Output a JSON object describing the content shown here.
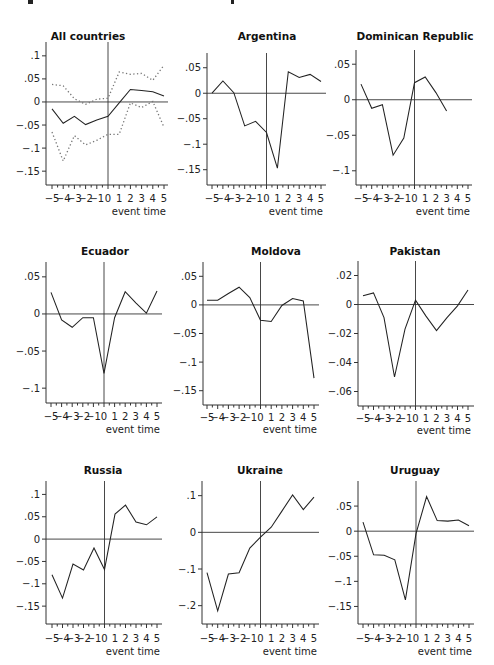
{
  "chart_data": [
    {
      "type": "line",
      "title": "All countries",
      "xlabel": "event time",
      "ylabel": "",
      "x": [
        -5,
        -4,
        -3,
        -2,
        -1,
        0,
        1,
        2,
        3,
        4,
        5
      ],
      "x_tick_labels": [
        "−5",
        "−4",
        "−3",
        "−2",
        "−1",
        "0",
        "1",
        "2",
        "3",
        "4",
        "5"
      ],
      "y_ticks": [
        0.1,
        0.05,
        0,
        -0.05,
        -0.1,
        -0.15
      ],
      "y_tick_labels": [
        ".1",
        ".05",
        "0",
        "−.05",
        "−.1",
        "−.15"
      ],
      "ylim": [
        -0.18,
        0.13
      ],
      "series": [
        {
          "name": "estimate",
          "style": "solid",
          "values": [
            -0.015,
            -0.046,
            -0.031,
            -0.049,
            -0.039,
            -0.031,
            -0.002,
            0.027,
            0.025,
            0.022,
            0.013
          ]
        },
        {
          "name": "upper CI",
          "style": "dotted",
          "values": [
            0.038,
            0.035,
            0.007,
            -0.005,
            0.006,
            0.008,
            0.065,
            0.06,
            0.062,
            0.047,
            0.08
          ]
        },
        {
          "name": "lower CI",
          "style": "dotted",
          "values": [
            -0.065,
            -0.128,
            -0.073,
            -0.093,
            -0.083,
            -0.07,
            -0.07,
            -0.002,
            -0.012,
            0.001,
            -0.055
          ]
        }
      ],
      "reference_lines": {
        "x": 0,
        "y": 0
      },
      "grid": false,
      "legend": "none"
    },
    {
      "type": "line",
      "title": "Argentina",
      "xlabel": "event time",
      "x": [
        -5,
        -4,
        -3,
        -2,
        -1,
        0,
        1,
        2,
        3,
        4,
        5
      ],
      "x_tick_labels": [
        "−5",
        "−4",
        "−3",
        "−2",
        "−1",
        "0",
        "1",
        "2",
        "3",
        "4",
        "5"
      ],
      "y_ticks": [
        0.05,
        0,
        -0.05,
        -0.1,
        -0.15
      ],
      "y_tick_labels": [
        ".05",
        "0",
        "−.05",
        "−.1",
        "−.15"
      ],
      "ylim": [
        -0.18,
        0.075
      ],
      "series": [
        {
          "name": "estimate",
          "style": "solid",
          "values": [
            0.0,
            0.024,
            0.001,
            -0.064,
            -0.055,
            -0.077,
            -0.147,
            0.042,
            0.031,
            0.037,
            0.023
          ]
        }
      ],
      "reference_lines": {
        "x": 0,
        "y": 0
      },
      "grid": false,
      "legend": "none"
    },
    {
      "type": "line",
      "title": "Dominican Republic",
      "xlabel": "event time",
      "x": [
        -5,
        -4,
        -3,
        -2,
        -1,
        0,
        1,
        2,
        3,
        4,
        5
      ],
      "x_tick_labels": [
        "−5",
        "−4",
        "−3",
        "−2",
        "−1",
        "0",
        "1",
        "2",
        "3",
        "4",
        "5"
      ],
      "y_ticks": [
        0.05,
        0,
        -0.05,
        -0.1
      ],
      "y_tick_labels": [
        ".05",
        "0",
        "−.05",
        "−.1"
      ],
      "ylim": [
        -0.12,
        0.07
      ],
      "series": [
        {
          "name": "estimate",
          "style": "solid",
          "values": [
            0.022,
            -0.012,
            -0.007,
            -0.078,
            -0.054,
            0.024,
            0.032,
            0.01,
            -0.016,
            null,
            null
          ]
        }
      ],
      "reference_lines": {
        "x": 0,
        "y": 0
      },
      "grid": false,
      "legend": "none"
    },
    {
      "type": "line",
      "title": "Ecuador",
      "xlabel": "event time",
      "x": [
        -5,
        -4,
        -3,
        -2,
        -1,
        0,
        1,
        2,
        3,
        4,
        5
      ],
      "x_tick_labels": [
        "−5",
        "−4",
        "−3",
        "−2",
        "−1",
        "0",
        "1",
        "2",
        "3",
        "4",
        "5"
      ],
      "y_ticks": [
        0.05,
        0,
        -0.05,
        -0.1
      ],
      "y_tick_labels": [
        ".05",
        "0",
        "−.05",
        "−.1"
      ],
      "ylim": [
        -0.12,
        0.07
      ],
      "series": [
        {
          "name": "estimate",
          "style": "solid",
          "values": [
            0.029,
            -0.008,
            -0.018,
            -0.005,
            -0.005,
            -0.08,
            -0.005,
            0.03,
            0.015,
            0.001,
            0.031
          ]
        }
      ],
      "reference_lines": {
        "x": 0,
        "y": 0
      },
      "grid": false,
      "legend": "none"
    },
    {
      "type": "line",
      "title": "Moldova",
      "xlabel": "event time",
      "x": [
        -5,
        -4,
        -3,
        -2,
        -1,
        0,
        1,
        2,
        3,
        4,
        5
      ],
      "x_tick_labels": [
        "−5",
        "−4",
        "−3",
        "−2",
        "−1",
        "0",
        "1",
        "2",
        "3",
        "4",
        "5"
      ],
      "y_ticks": [
        0.05,
        0,
        -0.05,
        -0.1,
        -0.15
      ],
      "y_tick_labels": [
        ".05",
        "0",
        "−.05",
        "−.1",
        "−.15"
      ],
      "ylim": [
        -0.175,
        0.075
      ],
      "series": [
        {
          "name": "estimate",
          "style": "solid",
          "values": [
            0.008,
            0.008,
            0.02,
            0.031,
            0.013,
            -0.027,
            -0.029,
            -0.001,
            0.011,
            0.007,
            -0.128
          ]
        }
      ],
      "reference_lines": {
        "x": 0,
        "y": 0
      },
      "grid": false,
      "legend": "none"
    },
    {
      "type": "line",
      "title": "Pakistan",
      "xlabel": "event time",
      "x": [
        -5,
        -4,
        -3,
        -2,
        -1,
        0,
        1,
        2,
        3,
        4,
        5
      ],
      "x_tick_labels": [
        "−5",
        "−4",
        "−3",
        "−2",
        "−1",
        "0",
        "1",
        "2",
        "3",
        "4",
        "5"
      ],
      "y_ticks": [
        0.02,
        0,
        -0.02,
        -0.04,
        -0.06
      ],
      "y_tick_labels": [
        ".02",
        "0",
        "−.02",
        "−.04",
        "−.06"
      ],
      "ylim": [
        -0.07,
        0.03
      ],
      "series": [
        {
          "name": "estimate",
          "style": "solid",
          "values": [
            0.006,
            0.008,
            -0.009,
            -0.05,
            -0.017,
            0.003,
            -0.008,
            -0.018,
            -0.009,
            -0.001,
            0.01
          ]
        }
      ],
      "reference_lines": {
        "x": 0,
        "y": 0
      },
      "grid": false,
      "legend": "none"
    },
    {
      "type": "line",
      "title": "Russia",
      "xlabel": "event time",
      "x": [
        -5,
        -4,
        -3,
        -2,
        -1,
        0,
        1,
        2,
        3,
        4,
        5
      ],
      "x_tick_labels": [
        "−5",
        "−4",
        "−3",
        "−2",
        "−1",
        "0",
        "1",
        "2",
        "3",
        "4",
        "5"
      ],
      "y_ticks": [
        0.1,
        0.05,
        0,
        -0.05,
        -0.1,
        -0.15
      ],
      "y_tick_labels": [
        ".1",
        ".05",
        "0",
        "−.05",
        "−.1",
        "−.15"
      ],
      "ylim": [
        -0.19,
        0.13
      ],
      "series": [
        {
          "name": "estimate",
          "style": "solid",
          "values": [
            -0.08,
            -0.132,
            -0.056,
            -0.069,
            -0.02,
            -0.068,
            0.056,
            0.076,
            0.038,
            0.032,
            0.05
          ]
        }
      ],
      "reference_lines": {
        "x": 0,
        "y": 0
      },
      "grid": false,
      "legend": "none"
    },
    {
      "type": "line",
      "title": "Ukraine",
      "xlabel": "event time",
      "x": [
        -5,
        -4,
        -3,
        -2,
        -1,
        0,
        1,
        2,
        3,
        4,
        5
      ],
      "x_tick_labels": [
        "−5",
        "−4",
        "−3",
        "−2",
        "−1",
        "0",
        "1",
        "2",
        "3",
        "4",
        "5"
      ],
      "y_ticks": [
        0.1,
        0,
        -0.1,
        -0.2
      ],
      "y_tick_labels": [
        ".1",
        "0",
        "−.1",
        "−.2"
      ],
      "ylim": [
        -0.25,
        0.14
      ],
      "series": [
        {
          "name": "estimate",
          "style": "solid",
          "values": [
            -0.11,
            -0.214,
            -0.114,
            -0.11,
            -0.043,
            -0.013,
            0.014,
            0.058,
            0.102,
            0.062,
            0.096
          ]
        }
      ],
      "reference_lines": {
        "x": 0,
        "y": 0
      },
      "grid": false,
      "legend": "none"
    },
    {
      "type": "line",
      "title": "Uruguay",
      "xlabel": "event time",
      "x": [
        -5,
        -4,
        -3,
        -2,
        -1,
        0,
        1,
        2,
        3,
        4,
        5
      ],
      "x_tick_labels": [
        "−5",
        "−4",
        "−3",
        "−2",
        "−1",
        "0",
        "1",
        "2",
        "3",
        "4",
        "5"
      ],
      "y_ticks": [
        0.05,
        0,
        -0.05,
        -0.1,
        -0.15
      ],
      "y_tick_labels": [
        ".05",
        "0",
        "−.05",
        "−.1",
        "−.15"
      ],
      "ylim": [
        -0.185,
        0.1
      ],
      "series": [
        {
          "name": "estimate",
          "style": "solid",
          "values": [
            0.018,
            -0.047,
            -0.048,
            -0.057,
            -0.137,
            -0.005,
            0.069,
            0.021,
            0.02,
            0.022,
            0.011
          ]
        }
      ],
      "reference_lines": {
        "x": 0,
        "y": 0
      },
      "grid": false,
      "legend": "none"
    }
  ],
  "layout": {
    "panels": [
      {
        "title_x": 88,
        "title_y": 40,
        "ax_x": 46,
        "ax_top": 42,
        "ax_right": 168,
        "x0": 52,
        "x1": 164,
        "y_top_val": 0.13,
        "y_top_px": 42,
        "y_bot_val": -0.18,
        "y_bot_px": 185,
        "base_y": 185,
        "tick_label_y": 196,
        "xlabel_x": 166,
        "xlabel_y": 212
      },
      {
        "title_x": 267,
        "title_y": 40,
        "ax_x": 207,
        "ax_top": 53,
        "ax_right": 326,
        "x0": 212,
        "x1": 321,
        "y_top_val": 0.075,
        "y_top_px": 55,
        "y_bot_val": -0.18,
        "y_bot_px": 185,
        "base_y": 185,
        "tick_label_y": 196,
        "xlabel_x": 323,
        "xlabel_y": 212
      },
      {
        "title_x": 415,
        "title_y": 40,
        "ax_x": 356,
        "ax_top": 50,
        "ax_right": 472,
        "x0": 361,
        "x1": 468,
        "y_top_val": 0.07,
        "y_top_px": 50,
        "y_bot_val": -0.12,
        "y_bot_px": 185,
        "base_y": 185,
        "tick_label_y": 196,
        "xlabel_x": 470,
        "xlabel_y": 212
      },
      {
        "title_x": 105,
        "title_y": 255,
        "ax_x": 46,
        "ax_top": 262,
        "ax_right": 162,
        "x0": 51,
        "x1": 157,
        "y_top_val": 0.07,
        "y_top_px": 262,
        "y_bot_val": -0.12,
        "y_bot_px": 403,
        "base_y": 403,
        "tick_label_y": 414,
        "xlabel_x": 160,
        "xlabel_y": 430
      },
      {
        "title_x": 276,
        "title_y": 255,
        "ax_x": 203,
        "ax_top": 262,
        "ax_right": 319,
        "x0": 207,
        "x1": 314,
        "y_top_val": 0.075,
        "y_top_px": 262,
        "y_bot_val": -0.175,
        "y_bot_px": 405,
        "base_y": 405,
        "tick_label_y": 415,
        "xlabel_x": 317,
        "xlabel_y": 430
      },
      {
        "title_x": 415,
        "title_y": 255,
        "ax_x": 358,
        "ax_top": 261,
        "ax_right": 474,
        "x0": 363,
        "x1": 468,
        "y_top_val": 0.03,
        "y_top_px": 261,
        "y_bot_val": -0.07,
        "y_bot_px": 406,
        "base_y": 406,
        "tick_label_y": 416,
        "xlabel_x": 471,
        "xlabel_y": 431
      },
      {
        "title_x": 103,
        "title_y": 474,
        "ax_x": 46,
        "ax_top": 481,
        "ax_right": 162,
        "x0": 52,
        "x1": 157,
        "y_top_val": 0.13,
        "y_top_px": 481,
        "y_bot_val": -0.19,
        "y_bot_px": 624,
        "base_y": 624,
        "tick_label_y": 636,
        "xlabel_x": 160,
        "xlabel_y": 652
      },
      {
        "title_x": 260,
        "title_y": 474,
        "ax_x": 202,
        "ax_top": 481,
        "ax_right": 319,
        "x0": 207,
        "x1": 314,
        "y_top_val": 0.14,
        "y_top_px": 481,
        "y_bot_val": -0.25,
        "y_bot_px": 624,
        "base_y": 624,
        "tick_label_y": 636,
        "xlabel_x": 317,
        "xlabel_y": 652
      },
      {
        "title_x": 415,
        "title_y": 474,
        "ax_x": 358,
        "ax_top": 481,
        "ax_right": 474,
        "x0": 363,
        "x1": 469,
        "y_top_val": 0.1,
        "y_top_px": 481,
        "y_bot_val": -0.185,
        "y_bot_px": 624,
        "base_y": 624,
        "tick_label_y": 636,
        "xlabel_x": 472,
        "xlabel_y": 652
      }
    ]
  }
}
